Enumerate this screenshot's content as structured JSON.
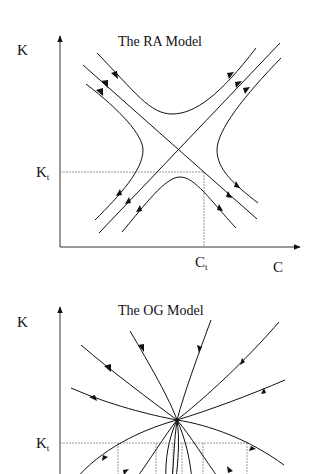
{
  "diagrams": [
    {
      "id": "ra",
      "title": "The RA Model",
      "y_axis_label": "K",
      "x_axis_label": "C",
      "k_marker": {
        "base": "K",
        "sub": "t"
      },
      "c_marker": {
        "base": "C",
        "sub": "t"
      },
      "type": "saddle-point phase diagram"
    },
    {
      "id": "og",
      "title": "The OG Model",
      "y_axis_label": "K",
      "k_marker": {
        "base": "K",
        "sub": "t"
      },
      "type": "stable node phase diagram"
    }
  ],
  "colors": {
    "line": "#1a1a1a",
    "guide": "#9a9a9a",
    "background": "#ffffff"
  }
}
